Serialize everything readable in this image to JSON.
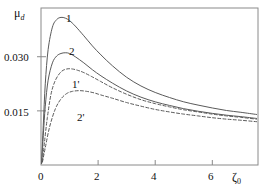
{
  "chart_data": {
    "type": "line",
    "title": "",
    "xlabel": "ζ₀",
    "ylabel": "μ_d",
    "xlabel_base": "ζ",
    "xlabel_sub": "0",
    "ylabel_base": "μ",
    "ylabel_sub": "d",
    "xlim": [
      0,
      7.6
    ],
    "ylim": [
      0,
      0.0435
    ],
    "xticks": [
      0,
      2,
      4,
      6
    ],
    "xtick_labels": [
      "0",
      "2",
      "4",
      "6"
    ],
    "yticks": [
      0.015,
      0.03
    ],
    "ytick_labels": [
      "0.015",
      "0.030"
    ],
    "grid": false,
    "legend": "inline-curve-labels",
    "series": [
      {
        "name": "1",
        "label": "1",
        "style": "solid",
        "color": "#5a5a5a",
        "x": [
          0.02,
          0.08,
          0.15,
          0.25,
          0.4,
          0.55,
          0.7,
          0.85,
          1.0,
          1.2,
          1.5,
          1.8,
          2.1,
          2.5,
          3.0,
          3.5,
          4.0,
          4.5,
          5.0,
          5.5,
          6.0,
          6.5,
          7.0,
          7.55
        ],
        "y": [
          0.0005,
          0.011,
          0.0225,
          0.032,
          0.0382,
          0.0403,
          0.0409,
          0.0407,
          0.04,
          0.0385,
          0.0358,
          0.033,
          0.0305,
          0.0275,
          0.0243,
          0.0219,
          0.0201,
          0.0187,
          0.0175,
          0.0166,
          0.0158,
          0.0151,
          0.0146,
          0.014
        ]
      },
      {
        "name": "2",
        "label": "2",
        "style": "solid",
        "color": "#5a5a5a",
        "x": [
          0.02,
          0.08,
          0.15,
          0.25,
          0.4,
          0.55,
          0.7,
          0.85,
          1.0,
          1.2,
          1.5,
          1.8,
          2.1,
          2.5,
          3.0,
          3.5,
          4.0,
          4.5,
          5.0,
          5.5,
          6.0,
          6.5,
          7.0,
          7.55
        ],
        "y": [
          0.0004,
          0.0082,
          0.0163,
          0.0235,
          0.0283,
          0.0302,
          0.0309,
          0.0311,
          0.0309,
          0.03,
          0.0283,
          0.0264,
          0.0247,
          0.0227,
          0.0205,
          0.0188,
          0.0175,
          0.0165,
          0.0156,
          0.0149,
          0.0143,
          0.0138,
          0.0134,
          0.0129
        ]
      },
      {
        "name": "1'",
        "label": "1'",
        "style": "dashed",
        "color": "#5a5a5a",
        "x": [
          0.05,
          0.12,
          0.22,
          0.35,
          0.5,
          0.7,
          0.9,
          1.1,
          1.3,
          1.5,
          1.8,
          2.1,
          2.5,
          3.0,
          3.5,
          4.0,
          4.5,
          5.0,
          5.5,
          6.0,
          6.5,
          7.0,
          7.55
        ],
        "y": [
          0.001,
          0.0062,
          0.013,
          0.0196,
          0.0234,
          0.0258,
          0.0266,
          0.0266,
          0.0262,
          0.0256,
          0.0244,
          0.0231,
          0.0214,
          0.0196,
          0.0181,
          0.017,
          0.0161,
          0.0153,
          0.0147,
          0.0141,
          0.0136,
          0.0132,
          0.0127
        ]
      },
      {
        "name": "2'",
        "label": "2'",
        "style": "dashed",
        "color": "#5a5a5a",
        "x": [
          0.05,
          0.15,
          0.3,
          0.5,
          0.7,
          0.9,
          1.1,
          1.35,
          1.6,
          1.85,
          2.1,
          2.5,
          3.0,
          3.5,
          4.0,
          4.5,
          5.0,
          5.5,
          6.0,
          6.5,
          7.0,
          7.55
        ],
        "y": [
          0.0008,
          0.0048,
          0.0105,
          0.0155,
          0.0183,
          0.0198,
          0.0204,
          0.0206,
          0.0204,
          0.02,
          0.0194,
          0.0185,
          0.0173,
          0.0163,
          0.0154,
          0.0147,
          0.0141,
          0.0136,
          0.0131,
          0.0127,
          0.0124,
          0.012
        ]
      }
    ],
    "annotations": [
      {
        "text": "1",
        "x": 0.95,
        "y": 0.0428
      },
      {
        "text": "2",
        "x": 1.05,
        "y": 0.0337
      },
      {
        "text": "1'",
        "x": 1.15,
        "y": 0.0245
      },
      {
        "text": "2'",
        "x": 1.3,
        "y": 0.015
      }
    ]
  },
  "axes": {
    "x_title_base": "ζ",
    "x_title_sub": "0",
    "y_title_base": "μ",
    "y_title_sub": "d",
    "xtick_0": "0",
    "xtick_2": "2",
    "xtick_4": "4",
    "xtick_6": "6",
    "ytick_015": "0.015",
    "ytick_030": "0.030"
  },
  "curve_labels": {
    "c1": "1",
    "c2": "2",
    "c1p": "1'",
    "c2p": "2'"
  },
  "colors": {
    "frame": "#8a8a8a",
    "curve": "#5a5a5a",
    "text": "#111111",
    "background": "#ffffff"
  }
}
